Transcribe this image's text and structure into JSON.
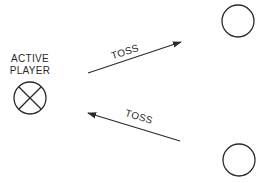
{
  "diagram": {
    "active_player": {
      "label_line1": "ACTIVE",
      "label_line2": "PLAYER",
      "symbol": "circle-x-icon",
      "center": [
        30,
        98
      ],
      "radius": 16
    },
    "receivers": [
      {
        "name": "player-top-right",
        "symbol": "circle-icon",
        "center": [
          238,
          21
        ],
        "radius": 16
      },
      {
        "name": "player-bottom-right",
        "symbol": "circle-icon",
        "center": [
          239,
          160
        ],
        "radius": 16
      }
    ],
    "arrows": [
      {
        "label": "TOSS",
        "from": [
          88,
          73
        ],
        "to": [
          181,
          42
        ],
        "direction": "toward top-right player"
      },
      {
        "label": "TOSS",
        "from": [
          180,
          141
        ],
        "to": [
          88,
          113
        ],
        "direction": "toward active player"
      }
    ],
    "colors": {
      "ink": "#2a2a2a",
      "background": "#ffffff"
    }
  }
}
